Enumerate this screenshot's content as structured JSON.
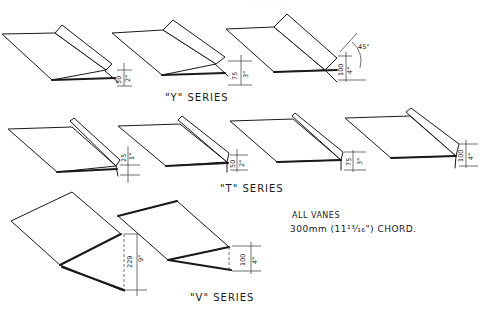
{
  "diagram": {
    "header_faint": "· · · · · · · · · ·",
    "series": [
      {
        "label": "\"Y\" SERIES",
        "vanes": [
          {
            "dim_mm": "50",
            "dim_in": "2\""
          },
          {
            "dim_mm": "75",
            "dim_in": "3\""
          },
          {
            "dim_mm": "100",
            "dim_in": "4\"",
            "angle": "45°"
          }
        ]
      },
      {
        "label": "\"T\" SERIES",
        "vanes": [
          {
            "dim_mm": "25",
            "dim_in": "1\""
          },
          {
            "dim_mm": "50",
            "dim_in": "2\""
          },
          {
            "dim_mm": "75",
            "dim_in": "3\""
          },
          {
            "dim_mm": "100",
            "dim_in": "4\""
          }
        ]
      },
      {
        "label": "\"V\" SERIES",
        "vanes": [
          {
            "dim_mm": "229",
            "dim_in": "9\""
          },
          {
            "dim_mm": "100",
            "dim_in": "4\""
          }
        ]
      }
    ],
    "note": {
      "line1": "ALL VANES",
      "line2": "300mm (11¹³⁄₁₆\") CHORD."
    }
  }
}
